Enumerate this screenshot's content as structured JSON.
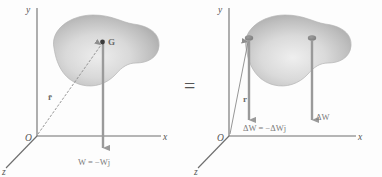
{
  "figure": {
    "background_color": "#fdfdfd",
    "equals_sign": "=",
    "colors": {
      "axis": "#6e6e6e",
      "arrow": "#9a9a9a",
      "body_fill_light": "#e3e3e3",
      "body_fill_dark": "#a9a9a9",
      "text": "#555555",
      "force_text": "#7a7a7a"
    },
    "left_panel": {
      "name": "resultant-weight-diagram",
      "axes": {
        "y_label": "y",
        "x_label": "x",
        "z_label": "z",
        "origin_label": "O"
      },
      "center_of_gravity_label": "G",
      "position_vector_label": "r̄",
      "force_label": "W = −Wj",
      "arrow_count": 1
    },
    "right_panel": {
      "name": "elemental-weights-diagram",
      "axes": {
        "y_label": "y",
        "x_label": "x",
        "z_label": "z",
        "origin_label": "O"
      },
      "position_vector_label": "r",
      "force_label_left": "ΔW = −ΔWj",
      "force_label_right": "ΔW",
      "arrow_count": 2
    }
  }
}
